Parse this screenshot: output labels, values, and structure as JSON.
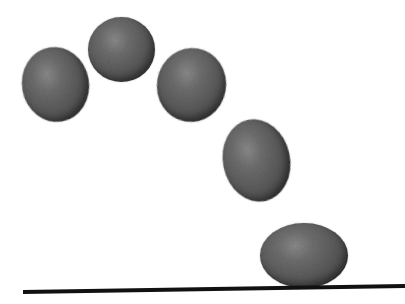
{
  "figure": {
    "title": "Bouncing ball squash and stretch",
    "background": "#ffffff",
    "ball_color": {
      "highlight": "#8a8a8a",
      "midtone": "#5a5a5a",
      "shadow": "#333333"
    },
    "ground_color": "#111111",
    "balls": [
      {
        "id": 1,
        "cx": 55,
        "cy": 84,
        "width": 67,
        "height": 75,
        "rotation": -10,
        "state": "rising"
      },
      {
        "id": 2,
        "cx": 121,
        "cy": 49,
        "width": 67,
        "height": 65,
        "rotation": 0,
        "state": "apex"
      },
      {
        "id": 3,
        "cx": 191,
        "cy": 85,
        "width": 69,
        "height": 74,
        "rotation": 10,
        "state": "falling"
      },
      {
        "id": 4,
        "cx": 256,
        "cy": 160,
        "width": 67,
        "height": 83,
        "rotation": -12,
        "state": "stretch"
      },
      {
        "id": 5,
        "cx": 304,
        "cy": 255,
        "width": 88,
        "height": 65,
        "rotation": 0,
        "state": "squash"
      }
    ],
    "ground": {
      "x1": 23,
      "y1": 292,
      "x2": 405,
      "y2": 286,
      "thickness": 4
    }
  }
}
